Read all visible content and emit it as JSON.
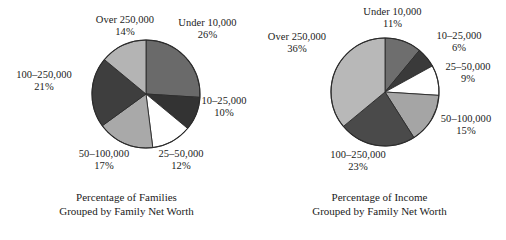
{
  "chart_data": [
    {
      "type": "pie",
      "title": "Percentage of Families Grouped by Family Net Worth",
      "title_line1": "Percentage of Families",
      "title_line2": "Grouped by Family Net Worth",
      "categories": [
        "Under 10,000",
        "10–25,000",
        "25–50,000",
        "50–100,000",
        "100–250,000",
        "Over 250,000"
      ],
      "values": [
        26,
        10,
        12,
        17,
        21,
        14
      ],
      "value_suffix": "%",
      "labels": [
        "26%",
        "10%",
        "12%",
        "17%",
        "21%",
        "14%"
      ],
      "colors": [
        "#6a6a6a",
        "#333333",
        "#ffffff",
        "#a9a9a9",
        "#3e3e3e",
        "#b4b4b4"
      ],
      "start_angle_deg": 0,
      "direction": "clockwise",
      "legend": "none",
      "grid": false,
      "xlabel": "",
      "ylabel": ""
    },
    {
      "type": "pie",
      "title": "Percentage of Income Grouped by Family Net Worth",
      "title_line1": "Percentage of Income",
      "title_line2": "Grouped by Family Net Worth",
      "categories": [
        "Under 10,000",
        "10–25,000",
        "25–50,000",
        "50–100,000",
        "100–250,000",
        "Over 250,000"
      ],
      "values": [
        11,
        6,
        9,
        15,
        23,
        36
      ],
      "value_suffix": "%",
      "labels": [
        "11%",
        "6%",
        "9%",
        "15%",
        "23%",
        "36%"
      ],
      "colors": [
        "#6e6e6e",
        "#3a3a3a",
        "#ffffff",
        "#a5a5a5",
        "#4a4a4a",
        "#b8b8b8"
      ],
      "start_angle_deg": 0,
      "direction": "clockwise",
      "legend": "none",
      "grid": false,
      "xlabel": "",
      "ylabel": ""
    }
  ],
  "panels": [
    {
      "id": "families",
      "caption_line1": "Percentage of Families",
      "caption_line2": "Grouped by Family Net Worth",
      "center": {
        "x": 146,
        "y": 94
      },
      "radius": 54,
      "slices": [
        {
          "cat": "Under 10,000",
          "pct": "26%",
          "color": "#6a6a6a"
        },
        {
          "cat": "10–25,000",
          "pct": "10%",
          "color": "#333333"
        },
        {
          "cat": "25–50,000",
          "pct": "12%",
          "color": "#ffffff"
        },
        {
          "cat": "50–100,000",
          "pct": "17%",
          "color": "#a9a9a9"
        },
        {
          "cat": "100–250,000",
          "pct": "21%",
          "color": "#3e3e3e"
        },
        {
          "cat": "Over 250,000",
          "pct": "14%",
          "color": "#b4b4b4"
        }
      ]
    },
    {
      "id": "income",
      "caption_line1": "Percentage of Income",
      "caption_line2": "Grouped by Family Net Worth",
      "center": {
        "x": 132,
        "y": 92
      },
      "radius": 54,
      "slices": [
        {
          "cat": "Under 10,000",
          "pct": "11%",
          "color": "#6e6e6e"
        },
        {
          "cat": "10–25,000",
          "pct": "6%",
          "color": "#3a3a3a"
        },
        {
          "cat": "25–50,000",
          "pct": "9%",
          "color": "#ffffff"
        },
        {
          "cat": "50–100,000",
          "pct": "15%",
          "color": "#a5a5a5"
        },
        {
          "cat": "100–250,000",
          "pct": "23%",
          "color": "#4a4a4a"
        },
        {
          "cat": "Over 250,000",
          "pct": "36%",
          "color": "#b8b8b8"
        }
      ]
    }
  ]
}
